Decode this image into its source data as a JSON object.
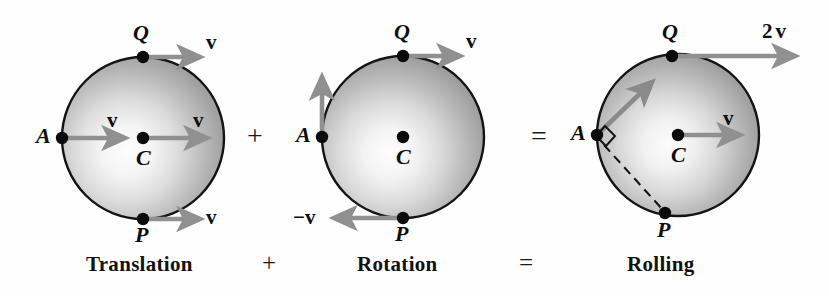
{
  "figure": {
    "background_color": "#fefefe",
    "arrow_color": "#8c8c8c",
    "outline_color": "#111111",
    "sphere_light_color": "#fbfbfb",
    "sphere_dark_color": "#8f8f8f"
  },
  "captions": {
    "translation": "Translation",
    "plus": "+",
    "rotation": "Rotation",
    "equals": "=",
    "rolling": "Rolling"
  },
  "operators": {
    "plus": "+",
    "equals": "="
  },
  "panels": [
    {
      "id": "translation",
      "caption": "Translation",
      "center": {
        "cx": 143,
        "cy": 138,
        "r": 81
      },
      "points": [
        {
          "name": "Q",
          "label": "Q",
          "x": 143,
          "y": 57
        },
        {
          "name": "A",
          "label": "A",
          "x": 62,
          "y": 138
        },
        {
          "name": "C",
          "label": "C",
          "x": 143,
          "y": 138
        },
        {
          "name": "P",
          "label": "P",
          "x": 143,
          "y": 219
        }
      ],
      "vectors": [
        {
          "at": "Q",
          "label": "v",
          "direction": "right",
          "magnitude": "v"
        },
        {
          "at": "A",
          "label": "v",
          "direction": "right",
          "magnitude": "v"
        },
        {
          "at": "C",
          "label": "v",
          "direction": "right",
          "magnitude": "v"
        },
        {
          "at": "P",
          "label": "v",
          "direction": "right",
          "magnitude": "v"
        }
      ]
    },
    {
      "id": "rotation",
      "caption": "Rotation",
      "center": {
        "cx": 403,
        "cy": 137,
        "r": 81
      },
      "points": [
        {
          "name": "Q",
          "label": "Q",
          "x": 403,
          "y": 56
        },
        {
          "name": "A",
          "label": "A",
          "x": 322,
          "y": 137
        },
        {
          "name": "C",
          "label": "C",
          "x": 403,
          "y": 137
        },
        {
          "name": "P",
          "label": "P",
          "x": 403,
          "y": 218
        }
      ],
      "vectors": [
        {
          "at": "Q",
          "label": "v",
          "direction": "right",
          "magnitude": "v"
        },
        {
          "at": "A",
          "label": "",
          "direction": "up",
          "magnitude": "v"
        },
        {
          "at": "P",
          "label": "-v",
          "direction": "left",
          "magnitude": "v"
        }
      ]
    },
    {
      "id": "rolling",
      "caption": "Rolling",
      "center": {
        "cx": 678,
        "cy": 135,
        "r": 81
      },
      "points": [
        {
          "name": "Q",
          "label": "Q",
          "x": 672,
          "y": 56
        },
        {
          "name": "A",
          "label": "A",
          "x": 597,
          "y": 135
        },
        {
          "name": "C",
          "label": "C",
          "x": 678,
          "y": 135
        },
        {
          "name": "P",
          "label": "P",
          "x": 665,
          "y": 213
        }
      ],
      "vectors": [
        {
          "at": "Q",
          "label": "2v",
          "direction": "right",
          "magnitude": "2v"
        },
        {
          "at": "A",
          "label": "",
          "direction": "diagonal-up-right",
          "magnitude": "1.41v"
        },
        {
          "at": "C",
          "label": "v",
          "direction": "right",
          "magnitude": "v"
        }
      ],
      "annotations": [
        {
          "name": "right-angle-mark",
          "at": "A"
        },
        {
          "name": "dashed-chord",
          "from": "A",
          "to": "P"
        }
      ]
    }
  ],
  "labels": {
    "v": "v",
    "neg_v": "−v",
    "two_v_prefix": "2",
    "two_v": "v",
    "Q": "Q",
    "A": "A",
    "C": "C",
    "P": "P"
  }
}
